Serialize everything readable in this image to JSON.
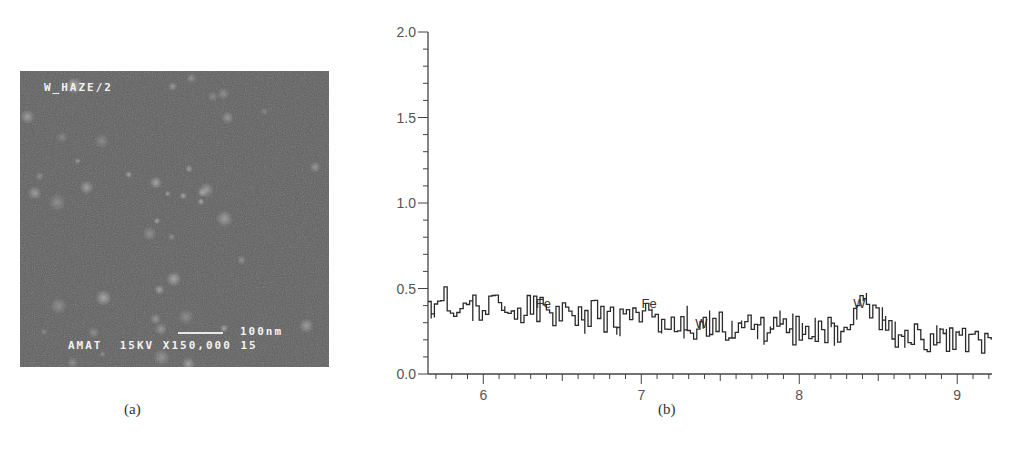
{
  "panel_a": {
    "caption": "(a)",
    "sem_title": "W_HAZE/2",
    "scale_label": "100nm",
    "info_line": "AMAT  15KV X150,000 15",
    "background_color": "#5e5e5e"
  },
  "panel_b": {
    "caption": "(b)"
  },
  "chart_data": {
    "type": "line",
    "title": "",
    "xlabel": "",
    "ylabel": "",
    "xlim": [
      5.65,
      9.22
    ],
    "ylim": [
      0.0,
      2.0
    ],
    "x_ticks": [
      "6",
      "7",
      "8",
      "9"
    ],
    "y_ticks": [
      "0.0",
      "0.5",
      "1.0",
      "1.5",
      "2.0"
    ],
    "grid": false,
    "legend": null,
    "annotations": [
      {
        "text": "Fe",
        "x": 6.38,
        "y": 0.4
      },
      {
        "text": "Fe",
        "x": 7.05,
        "y": 0.4
      },
      {
        "text": "W",
        "x": 7.38,
        "y": 0.28
      },
      {
        "text": "W",
        "x": 8.38,
        "y": 0.4
      }
    ],
    "series": [
      {
        "name": "EDS spectrum",
        "x": [
          5.65,
          5.7,
          5.75,
          5.8,
          5.85,
          5.9,
          5.95,
          6.0,
          6.05,
          6.1,
          6.15,
          6.2,
          6.25,
          6.3,
          6.35,
          6.4,
          6.45,
          6.5,
          6.55,
          6.6,
          6.65,
          6.7,
          6.75,
          6.8,
          6.85,
          6.9,
          6.95,
          7.0,
          7.05,
          7.1,
          7.15,
          7.2,
          7.25,
          7.3,
          7.35,
          7.4,
          7.45,
          7.5,
          7.55,
          7.6,
          7.65,
          7.7,
          7.75,
          7.8,
          7.85,
          7.9,
          7.95,
          8.0,
          8.05,
          8.1,
          8.15,
          8.2,
          8.25,
          8.3,
          8.35,
          8.4,
          8.45,
          8.5,
          8.55,
          8.6,
          8.65,
          8.7,
          8.75,
          8.8,
          8.85,
          8.9,
          8.95,
          9.0,
          9.05,
          9.1,
          9.15,
          9.2
        ],
        "values": [
          0.4,
          0.36,
          0.44,
          0.35,
          0.46,
          0.38,
          0.42,
          0.34,
          0.44,
          0.36,
          0.41,
          0.33,
          0.39,
          0.42,
          0.37,
          0.38,
          0.34,
          0.4,
          0.32,
          0.37,
          0.33,
          0.38,
          0.31,
          0.36,
          0.3,
          0.35,
          0.32,
          0.37,
          0.34,
          0.31,
          0.33,
          0.28,
          0.32,
          0.29,
          0.25,
          0.3,
          0.27,
          0.29,
          0.25,
          0.31,
          0.27,
          0.28,
          0.25,
          0.29,
          0.26,
          0.28,
          0.24,
          0.27,
          0.25,
          0.27,
          0.23,
          0.28,
          0.26,
          0.3,
          0.4,
          0.41,
          0.36,
          0.3,
          0.28,
          0.22,
          0.26,
          0.2,
          0.24,
          0.19,
          0.23,
          0.18,
          0.22,
          0.19,
          0.21,
          0.17,
          0.2,
          0.16
        ]
      }
    ]
  }
}
